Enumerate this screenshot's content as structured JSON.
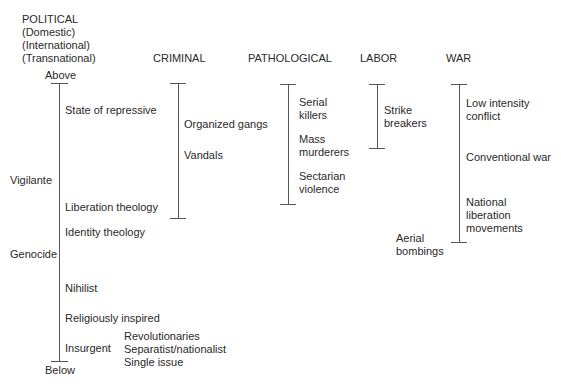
{
  "columns": {
    "political": {
      "title": "POLITICAL",
      "subtitle_lines": [
        "(Domestic)",
        "(International)",
        "(Transnational)"
      ],
      "top_label": "Above",
      "bottom_label": "Below",
      "left_labels": [
        "Vigilante",
        "Genocide"
      ],
      "items": [
        "State of repressive",
        "Liberation theology",
        "Identity theology",
        "Nihilist",
        "Religiously inspired",
        "Insurgent"
      ],
      "insurgent_subtypes": [
        "Revolutionaries",
        "Separatist/nationalist",
        "Single issue"
      ]
    },
    "criminal": {
      "title": "CRIMINAL",
      "items": [
        "Organized gangs",
        "Vandals"
      ]
    },
    "pathological": {
      "title": "PATHOLOGICAL",
      "items": [
        [
          "Serial",
          "killers"
        ],
        [
          "Mass",
          "murderers"
        ],
        [
          "Sectarian",
          "violence"
        ]
      ]
    },
    "labor": {
      "title": "LABOR",
      "items": [
        [
          "Strike",
          "breakers"
        ]
      ]
    },
    "war": {
      "title": "WAR",
      "items": [
        [
          "Low intensity",
          "conflict"
        ],
        [
          "Conventional war"
        ],
        [
          "National",
          "liberation",
          "movements"
        ]
      ],
      "side_label": [
        "Aerial",
        "bombings"
      ]
    }
  },
  "colors": {
    "text": "#2a2a2a",
    "lines": "#555555"
  }
}
